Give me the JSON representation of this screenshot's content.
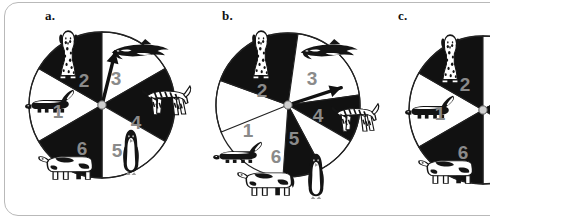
{
  "figure": {
    "type": "spinner-probability-figure",
    "background_color": "#ffffff",
    "sector_black": "#111111",
    "sector_white": "#ffffff",
    "digit_color": "#8a8a8a",
    "outline_color": "#222222",
    "frame_color": "#b9b9b9"
  },
  "panels": [
    {
      "id": "a",
      "label": "a.",
      "label_x": 45,
      "label_y": 8,
      "center_x": 102,
      "center_y": 105,
      "radius": 73,
      "equal_sectors": true,
      "arrow_angle_deg": -76,
      "arrow_length": 55,
      "sectors": [
        {
          "number": "1",
          "start_deg": 150,
          "end_deg": 210,
          "fill": "white",
          "digit_x": 58,
          "digit_y": 113,
          "animal": "skunk",
          "animal_x": 22,
          "animal_y": 88,
          "animal_w": 52,
          "animal_h": 30
        },
        {
          "number": "2",
          "start_deg": 210,
          "end_deg": 270,
          "fill": "black",
          "digit_x": 84,
          "digit_y": 82,
          "animal": "dalmatian",
          "animal_x": 50,
          "animal_y": 28,
          "animal_w": 36,
          "animal_h": 52
        },
        {
          "number": "3",
          "start_deg": 270,
          "end_deg": 330,
          "fill": "white",
          "digit_x": 116,
          "digit_y": 80,
          "animal": "orca",
          "animal_x": 108,
          "animal_y": 38,
          "animal_w": 62,
          "animal_h": 28
        },
        {
          "number": "4",
          "start_deg": 330,
          "end_deg": 30,
          "fill": "black",
          "digit_x": 136,
          "digit_y": 124,
          "animal": "zebra",
          "animal_x": 140,
          "animal_y": 82,
          "animal_w": 52,
          "animal_h": 40
        },
        {
          "number": "5",
          "start_deg": 30,
          "end_deg": 90,
          "fill": "white",
          "digit_x": 117,
          "digit_y": 152,
          "animal": "penguin",
          "animal_x": 118,
          "animal_y": 128,
          "animal_w": 26,
          "animal_h": 46
        },
        {
          "number": "6",
          "start_deg": 90,
          "end_deg": 150,
          "fill": "black",
          "digit_x": 82,
          "digit_y": 150,
          "animal": "cow",
          "animal_x": 38,
          "animal_y": 148,
          "animal_w": 58,
          "animal_h": 34
        }
      ]
    },
    {
      "id": "b",
      "label": "b.",
      "label_x": 222,
      "label_y": 8,
      "center_x": 288,
      "center_y": 105,
      "radius": 72,
      "equal_sectors": false,
      "arrow_angle_deg": -18,
      "arrow_length": 56,
      "sectors": [
        {
          "number": "1",
          "start_deg": 158,
          "end_deg": 200,
          "fill": "white",
          "digit_x": 248,
          "digit_y": 132,
          "animal": "skunk",
          "animal_x": 210,
          "animal_y": 140,
          "animal_w": 52,
          "animal_h": 28
        },
        {
          "number": "2",
          "start_deg": 200,
          "end_deg": 278,
          "fill": "black",
          "digit_x": 262,
          "digit_y": 92,
          "animal": "dalmatian",
          "animal_x": 243,
          "animal_y": 28,
          "animal_w": 36,
          "animal_h": 52
        },
        {
          "number": "3",
          "start_deg": 278,
          "end_deg": 352,
          "fill": "white",
          "digit_x": 312,
          "digit_y": 80,
          "animal": "orca",
          "animal_x": 297,
          "animal_y": 38,
          "animal_w": 62,
          "animal_h": 28
        },
        {
          "number": "4",
          "start_deg": 352,
          "end_deg": 30,
          "fill": "black",
          "digit_x": 318,
          "digit_y": 117,
          "animal": "zebra",
          "animal_x": 330,
          "animal_y": 100,
          "animal_w": 50,
          "animal_h": 38
        },
        {
          "number": "5",
          "start_deg": 30,
          "end_deg": 62,
          "fill": "white",
          "digit_x": 294,
          "digit_y": 140,
          "animal": "penguin",
          "animal_x": 303,
          "animal_y": 152,
          "animal_w": 26,
          "animal_h": 46
        },
        {
          "number": "6",
          "start_deg": 62,
          "end_deg": 94,
          "fill": "black",
          "digit_x": 276,
          "digit_y": 158,
          "animal": "cow",
          "animal_x": 237,
          "animal_y": 164,
          "animal_w": 58,
          "animal_h": 34
        }
      ]
    },
    {
      "id": "c",
      "label": "c.",
      "label_x": 398,
      "label_y": 8,
      "center_x": 483,
      "center_y": 110,
      "radius": 74,
      "equal_sectors": true,
      "arrow_angle_deg": -22,
      "arrow_length": 58,
      "sectors": [
        {
          "number": "1",
          "start_deg": 150,
          "end_deg": 210,
          "fill": "white",
          "digit_x": 440,
          "digit_y": 115,
          "animal": "skunk",
          "animal_x": 402,
          "animal_y": 94,
          "animal_w": 52,
          "animal_h": 30
        },
        {
          "number": "2",
          "start_deg": 210,
          "end_deg": 270,
          "fill": "black",
          "digit_x": 465,
          "digit_y": 86,
          "animal": "dalmatian",
          "animal_x": 432,
          "animal_y": 32,
          "animal_w": 36,
          "animal_h": 52
        },
        {
          "number": "3",
          "start_deg": 270,
          "end_deg": 330,
          "fill": "white",
          "digit_x": 500,
          "digit_y": 84,
          "animal": "orca",
          "animal_x": 490,
          "animal_y": 42,
          "animal_w": 62,
          "animal_h": 28
        },
        {
          "number": "4",
          "start_deg": 330,
          "end_deg": 30,
          "fill": "black",
          "digit_x": 517,
          "digit_y": 129,
          "animal": "zebra",
          "animal_x": 520,
          "animal_y": 104,
          "animal_w": 52,
          "animal_h": 40
        },
        {
          "number": "5",
          "start_deg": 30,
          "end_deg": 90,
          "fill": "white",
          "digit_x": 498,
          "digit_y": 156,
          "animal": "penguin",
          "animal_x": 497,
          "animal_y": 134,
          "animal_w": 26,
          "animal_h": 46
        },
        {
          "number": "6",
          "start_deg": 90,
          "end_deg": 150,
          "fill": "black",
          "digit_x": 463,
          "digit_y": 154,
          "animal": "cow",
          "animal_x": 418,
          "animal_y": 152,
          "animal_w": 58,
          "animal_h": 34
        }
      ]
    }
  ]
}
